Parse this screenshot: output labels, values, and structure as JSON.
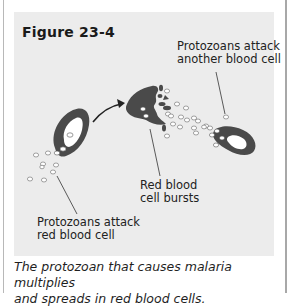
{
  "figure": {
    "title": "Figure 23-4",
    "labels": {
      "another_cell": [
        "Protozoans attack",
        "another blood cell"
      ],
      "bursts": [
        "Red blood",
        "cell bursts"
      ],
      "attack": [
        "Protozoans attack",
        "red blood cell"
      ]
    },
    "caption": [
      "The protozoan that causes malaria multiplies",
      "and spreads in red blood cells."
    ],
    "colors": {
      "panel": "#ececec",
      "cell": "#4a4a4a",
      "cell_center": "#ffffff",
      "text": "#222222"
    }
  }
}
